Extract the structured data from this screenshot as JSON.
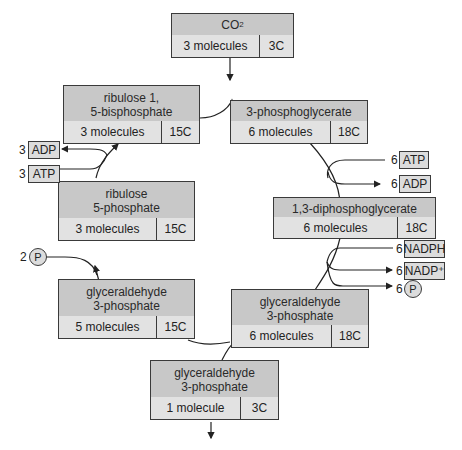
{
  "diagram": {
    "type": "Calvin cycle",
    "boxes": {
      "co2": {
        "name": "CO₂",
        "molecules": "3 molecules",
        "carbons": "3C"
      },
      "rubp": {
        "name_line1": "ribulose 1,",
        "name_line2": "5-bisphosphate",
        "molecules": "3 molecules",
        "carbons": "15C"
      },
      "pga": {
        "name": "3-phosphoglycerate",
        "molecules": "6 molecules",
        "carbons": "18C"
      },
      "dpg": {
        "name": "1,3-diphosphoglycerate",
        "molecules": "6 molecules",
        "carbons": "18C"
      },
      "g3p6": {
        "name_line1": "glyceraldehyde",
        "name_line2": "3-phosphate",
        "molecules": "6 molecules",
        "carbons": "18C"
      },
      "g3p5": {
        "name_line1": "glyceraldehyde",
        "name_line2": "3-phosphate",
        "molecules": "5 molecules",
        "carbons": "15C"
      },
      "ru5p": {
        "name_line1": "ribulose",
        "name_line2": "5-phosphate",
        "molecules": "3 molecules",
        "carbons": "15C"
      },
      "g3p1": {
        "name_line1": "glyceraldehyde",
        "name_line2": "3-phosphate",
        "molecules": "1 molecule",
        "carbons": "3C"
      }
    },
    "cofactors": {
      "adp_left": {
        "coef": "3",
        "label": "ADP"
      },
      "atp_left": {
        "coef": "3",
        "label": "ATP"
      },
      "atp_right": {
        "coef": "6",
        "label": "ATP"
      },
      "adp_right": {
        "coef": "6",
        "label": "ADP"
      },
      "nadph": {
        "coef": "6",
        "label": "NADPH"
      },
      "nadp": {
        "coef": "6",
        "label": "NADP⁺"
      },
      "pi_right": {
        "coef": "6",
        "label": "P"
      },
      "pi_left": {
        "coef": "2",
        "label": "P"
      }
    },
    "caption": "Figure — The Calvin cycle"
  }
}
